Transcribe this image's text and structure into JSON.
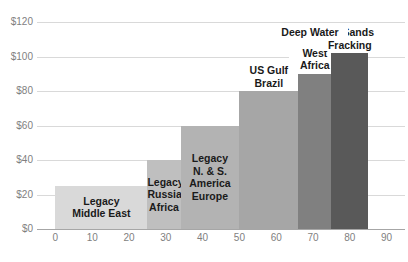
{
  "chart_data": {
    "type": "bar",
    "title": "",
    "subtitle": "",
    "xlabel": "",
    "ylabel": "",
    "xlim": [
      -5,
      95
    ],
    "ylim": [
      0,
      120
    ],
    "grid": true,
    "legend": "none",
    "orientation": "vertical",
    "note": "Oil supply cost curve: bar width = cumulative production volume, bar height = breakeven cost in US dollars",
    "y_ticks": [
      "$0",
      "$20",
      "$40",
      "$60",
      "$80",
      "$100",
      "$120"
    ],
    "y_tick_values": [
      0,
      20,
      40,
      60,
      80,
      100,
      120
    ],
    "x_ticks": [
      "0",
      "10",
      "20",
      "30",
      "40",
      "50",
      "60",
      "70",
      "80",
      "90"
    ],
    "x_tick_values": [
      0,
      10,
      20,
      30,
      40,
      50,
      60,
      70,
      80,
      90
    ],
    "categories": [
      "Legacy Middle East",
      "Legacy Russia Africa",
      "Legacy N. & S. America Europe",
      "US Gulf Brazil",
      "West Africa",
      "Oil Sands Fracking"
    ],
    "values": [
      25,
      40,
      60,
      80,
      90,
      102
    ],
    "bars": [
      {
        "label": "Legacy\nMiddle East",
        "value": 25,
        "x_start": 0,
        "x_end": 25,
        "color": "#d9d9d9",
        "label_position": "inside",
        "label_color": "#1a1a1a"
      },
      {
        "label": "Legacy\nRussia\nAfrica",
        "value": 40,
        "x_start": 25,
        "x_end": 34,
        "color": "#bfbfbf",
        "label_position": "inside",
        "label_color": "#1a1a1a"
      },
      {
        "label": "Legacy\nN. & S.\nAmerica\nEurope",
        "value": 60,
        "x_start": 34,
        "x_end": 50,
        "color": "#b3b3b3",
        "label_position": "inside",
        "label_color": "#1a1a1a"
      },
      {
        "label": "US Gulf\nBrazil",
        "value": 80,
        "x_start": 50,
        "x_end": 66,
        "color": "#a6a6a6",
        "label_position": "above",
        "label_color": "#1a1a1a"
      },
      {
        "label": "West\nAfrica",
        "value": 90,
        "x_start": 66,
        "x_end": 75,
        "color": "#808080",
        "label_position": "above",
        "label_color": "#1a1a1a"
      },
      {
        "label": "Oil Sands\nFracking",
        "value": 102,
        "x_start": 75,
        "x_end": 85,
        "color": "#595959",
        "label_position": "above",
        "label_color": "#1a1a1a"
      }
    ],
    "annotations": [
      {
        "text": "Deep Water",
        "target_bar": "US Gulf Brazil"
      }
    ],
    "colors": {
      "gridline": "#d9d9d9",
      "axis": "#a6a6a6",
      "tick_text": "#7f7f7f",
      "label_text": "#1a1a1a",
      "background": "#ffffff"
    }
  },
  "annotations": {
    "deep_water": "Deep Water"
  }
}
